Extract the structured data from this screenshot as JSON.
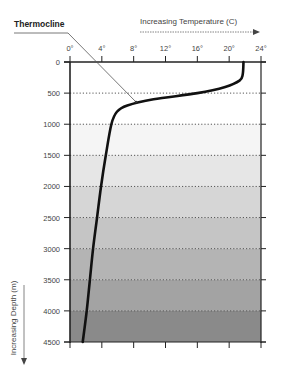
{
  "chart_data": {
    "type": "line",
    "title": "",
    "annotation": "Thermocline",
    "xlabel": "Increasing Temperature (C)",
    "ylabel": "Increasing Depth (m)",
    "x_ticks": [
      "0°",
      "4°",
      "8°",
      "12°",
      "16°",
      "20°",
      "24°"
    ],
    "y_ticks": [
      "0",
      "500",
      "1000",
      "1500",
      "2000",
      "2500",
      "3000",
      "3500",
      "4000",
      "4500"
    ],
    "xlim": [
      0,
      24
    ],
    "ylim": [
      0,
      4500
    ],
    "y_inverted": true,
    "x_axis_position": "top",
    "grid": "horizontal dotted every 500 m",
    "series": [
      {
        "name": "Temperature profile",
        "points": [
          {
            "depth": 0,
            "temp": 21.8
          },
          {
            "depth": 200,
            "temp": 21.7
          },
          {
            "depth": 300,
            "temp": 21.3
          },
          {
            "depth": 400,
            "temp": 19.5
          },
          {
            "depth": 500,
            "temp": 16.0
          },
          {
            "depth": 600,
            "temp": 10.5
          },
          {
            "depth": 700,
            "temp": 7.2
          },
          {
            "depth": 800,
            "temp": 5.9
          },
          {
            "depth": 1000,
            "temp": 5.2
          },
          {
            "depth": 1500,
            "temp": 4.5
          },
          {
            "depth": 2000,
            "temp": 3.9
          },
          {
            "depth": 2500,
            "temp": 3.4
          },
          {
            "depth": 3000,
            "temp": 2.9
          },
          {
            "depth": 3500,
            "temp": 2.5
          },
          {
            "depth": 4000,
            "temp": 2.1
          },
          {
            "depth": 4500,
            "temp": 1.6
          }
        ]
      }
    ],
    "depth_bands": [
      {
        "from": 0,
        "to": 1000,
        "color": "#ffffff"
      },
      {
        "from": 1000,
        "to": 1500,
        "color": "#f5f5f5"
      },
      {
        "from": 1500,
        "to": 2000,
        "color": "#e6e6e6"
      },
      {
        "from": 2000,
        "to": 2500,
        "color": "#d6d6d6"
      },
      {
        "from": 2500,
        "to": 3000,
        "color": "#c5c5c5"
      },
      {
        "from": 3000,
        "to": 3500,
        "color": "#b4b4b4"
      },
      {
        "from": 3500,
        "to": 4000,
        "color": "#a3a3a3"
      },
      {
        "from": 4000,
        "to": 4500,
        "color": "#8a8a8a"
      }
    ]
  }
}
